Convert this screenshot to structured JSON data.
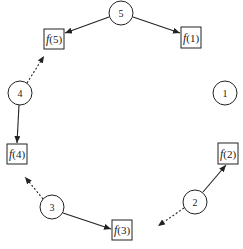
{
  "diagram": {
    "type": "ring-mapping",
    "circles": [
      {
        "id": "5",
        "label": "5",
        "cx": 121,
        "cy": 13,
        "r": 12
      },
      {
        "id": "4",
        "label": "4",
        "cx": 20,
        "cy": 93,
        "r": 12
      },
      {
        "id": "1",
        "label": "1",
        "cx": 225,
        "cy": 93,
        "r": 12
      },
      {
        "id": "3",
        "label": "3",
        "cx": 52,
        "cy": 207,
        "r": 12
      },
      {
        "id": "2",
        "label": "2",
        "cx": 195,
        "cy": 202,
        "r": 12
      }
    ],
    "boxes": [
      {
        "id": "f5",
        "fn": "f",
        "arg": "(5)",
        "x": 44,
        "y": 29,
        "w": 20,
        "h": 20
      },
      {
        "id": "f1",
        "fn": "f",
        "arg": "(1)",
        "x": 181,
        "y": 27,
        "w": 20,
        "h": 21
      },
      {
        "id": "f4",
        "fn": "f",
        "arg": "(4)",
        "x": 7,
        "y": 144,
        "w": 20,
        "h": 20
      },
      {
        "id": "f2",
        "fn": "f",
        "arg": "(2)",
        "x": 218,
        "y": 143,
        "w": 20,
        "h": 21
      },
      {
        "id": "f3",
        "fn": "f",
        "arg": "(3)",
        "x": 112,
        "y": 220,
        "w": 20,
        "h": 20
      }
    ],
    "edges": [
      {
        "from": "5",
        "to": "f(5)",
        "style": "solid",
        "x1": 109,
        "y1": 17,
        "x2": 65,
        "y2": 33
      },
      {
        "from": "5",
        "to": "f(1)",
        "style": "solid",
        "x1": 133,
        "y1": 17,
        "x2": 180,
        "y2": 33
      },
      {
        "from": "4",
        "to": "f(5)",
        "style": "dotted",
        "x1": 27,
        "y1": 83,
        "x2": 44,
        "y2": 56
      },
      {
        "from": "4",
        "to": "f(4)",
        "style": "solid",
        "x1": 19,
        "y1": 105,
        "x2": 17,
        "y2": 143
      },
      {
        "from": "3",
        "to": "f(4) direction",
        "style": "dotted",
        "x1": 43,
        "y1": 199,
        "x2": 25,
        "y2": 177
      },
      {
        "from": "3",
        "to": "f(3)",
        "style": "solid",
        "x1": 63,
        "y1": 213,
        "x2": 111,
        "y2": 229
      },
      {
        "from": "2",
        "to": "f(2)",
        "style": "solid",
        "x1": 203,
        "y1": 192,
        "x2": 226,
        "y2": 165
      },
      {
        "from": "2",
        "to": "f(3) direction",
        "style": "dotted",
        "x1": 184,
        "y1": 208,
        "x2": 158,
        "y2": 226
      }
    ]
  }
}
